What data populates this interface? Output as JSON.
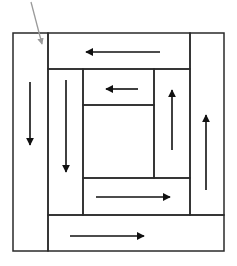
{
  "diagram": {
    "caption": "",
    "colors": {
      "line": "#2a2a2a",
      "arrow": "#111111",
      "pointer": "#9a9a9a",
      "background": "#ffffff"
    },
    "outer_frame": {
      "x": 13,
      "y": 33,
      "w": 211,
      "h": 218
    },
    "pieces": [
      {
        "id": "left-column",
        "x": 13,
        "y": 33,
        "w": 35,
        "h": 218,
        "arrow": "down"
      },
      {
        "id": "top-band",
        "x": 48,
        "y": 33,
        "w": 142,
        "h": 36,
        "arrow": "left"
      },
      {
        "id": "right-column",
        "x": 190,
        "y": 33,
        "w": 34,
        "h": 182,
        "arrow": "up"
      },
      {
        "id": "bottom-band",
        "x": 48,
        "y": 215,
        "w": 176,
        "h": 36,
        "arrow": "right"
      },
      {
        "id": "inner-left-column",
        "x": 48,
        "y": 69,
        "w": 35,
        "h": 146,
        "arrow": "down"
      },
      {
        "id": "inner-top-band",
        "x": 83,
        "y": 69,
        "w": 71,
        "h": 36,
        "arrow": "left"
      },
      {
        "id": "inner-right-column",
        "x": 154,
        "y": 69,
        "w": 36,
        "h": 109,
        "arrow": "up"
      },
      {
        "id": "inner-bottom-band",
        "x": 83,
        "y": 178,
        "w": 107,
        "h": 37,
        "arrow": "right"
      },
      {
        "id": "center-square",
        "x": 83,
        "y": 105,
        "w": 71,
        "h": 73,
        "arrow": "none"
      }
    ],
    "arrows": [
      {
        "id": "arrow-left-column",
        "direction": "down",
        "x1": 30,
        "y1": 82,
        "x2": 30,
        "y2": 145
      },
      {
        "id": "arrow-inner-left-column",
        "direction": "down",
        "x1": 66,
        "y1": 80,
        "x2": 66,
        "y2": 172
      },
      {
        "id": "arrow-top-band",
        "direction": "left",
        "x1": 160,
        "y1": 52,
        "x2": 86,
        "y2": 52
      },
      {
        "id": "arrow-inner-top-band",
        "direction": "left",
        "x1": 138,
        "y1": 89,
        "x2": 106,
        "y2": 89
      },
      {
        "id": "arrow-inner-right-column",
        "direction": "up",
        "x1": 172,
        "y1": 150,
        "x2": 172,
        "y2": 90
      },
      {
        "id": "arrow-right-column",
        "direction": "up",
        "x1": 206,
        "y1": 190,
        "x2": 206,
        "y2": 115
      },
      {
        "id": "arrow-inner-bottom-band",
        "direction": "right",
        "x1": 96,
        "y1": 197,
        "x2": 170,
        "y2": 197
      },
      {
        "id": "arrow-bottom-band",
        "direction": "right",
        "x1": 70,
        "y1": 236,
        "x2": 144,
        "y2": 236
      }
    ],
    "pointer": {
      "x1": 31,
      "y1": 2,
      "x2": 42,
      "y2": 44
    }
  }
}
